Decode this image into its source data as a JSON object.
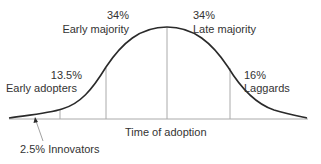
{
  "diagram": {
    "type": "bell-curve",
    "x_axis_label": "Time of adoption",
    "segments": [
      {
        "id": "innovators",
        "percent": "2.5%",
        "name": "Innovators",
        "label": "2.5% Innovators"
      },
      {
        "id": "early_adopters",
        "percent": "13.5%",
        "name": "Early adopters"
      },
      {
        "id": "early_majority",
        "percent": "34%",
        "name": "Early majority"
      },
      {
        "id": "late_majority",
        "percent": "34%",
        "name": "Late majority"
      },
      {
        "id": "laggards",
        "percent": "16%",
        "name": "Laggards"
      }
    ],
    "colors": {
      "curve": "#2a2a2a",
      "axis": "#999999",
      "dividers": "#999999",
      "text": "#333333"
    }
  }
}
